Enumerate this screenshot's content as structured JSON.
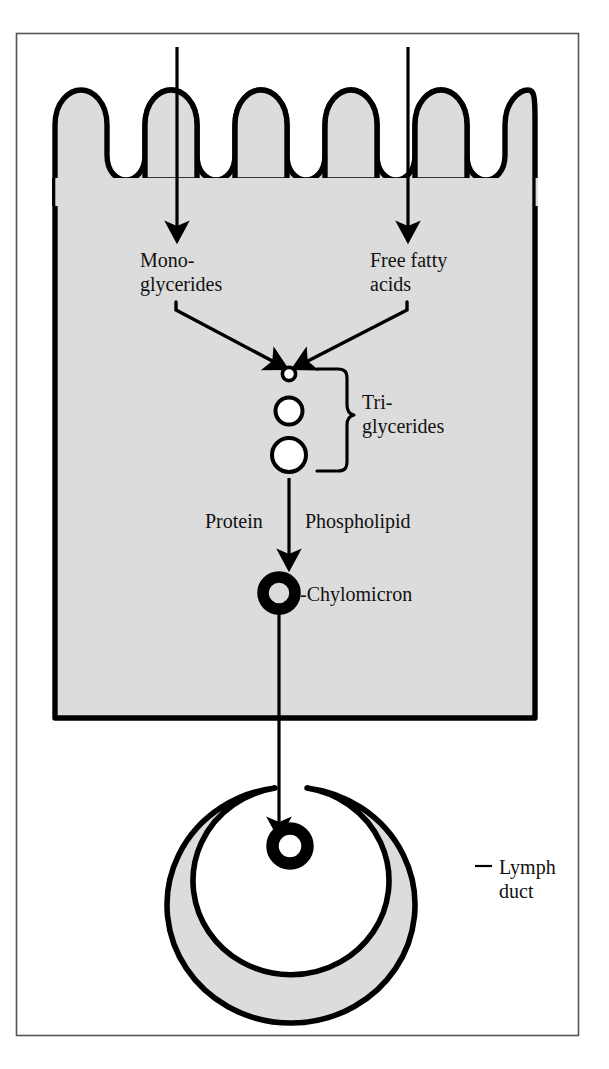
{
  "figure": {
    "border_color": "#555555",
    "cell_fill": "#dcdcdc",
    "stroke_color": "#000000",
    "background": "#ffffff"
  },
  "labels": {
    "monoglycerides_line1": "Mono-",
    "monoglycerides_line2": "glycerides",
    "free_fatty_acids_line1": "Free fatty",
    "free_fatty_acids_line2": "acids",
    "triglycerides_line1": "Tri-",
    "triglycerides_line2": "glycerides",
    "protein": "Protein",
    "phospholipid": "Phospholipid",
    "chylomicron": "-Chylomicron",
    "lymph_duct_line1": "Lymph",
    "lymph_duct_line2": "duct"
  },
  "structures": {
    "epithelial_cell": "epithelial-cell-block",
    "microvilli_count": 13,
    "triglyceride_droplets": 3,
    "chylomicron_in_cell": "chylomicron-ring",
    "chylomicron_in_duct": "chylomicron-ring-duct",
    "lymph_duct": "lymph-duct-ring"
  },
  "arrows": {
    "monoglycerides_inflow": "vertical-down-arrow-left",
    "free_fatty_acids_inflow": "vertical-down-arrow-right",
    "converge_left": "diagonal-arrow-left",
    "converge_right": "diagonal-arrow-right",
    "to_chylomicron": "vertical-arrow-to-chylomicron",
    "to_lymph_duct": "vertical-arrow-to-lymph-duct"
  }
}
